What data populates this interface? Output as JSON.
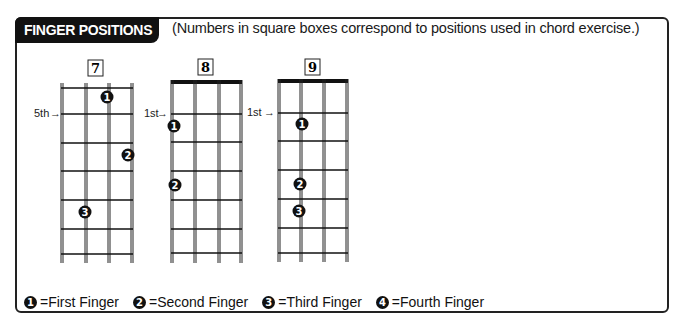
{
  "header": {
    "title": "FINGER POSITIONS",
    "subtitle": "(Numbers in square boxes correspond to positions used in chord exercise.)"
  },
  "diagrams": [
    {
      "number": "7",
      "position_label": "5th",
      "arrow": "→",
      "has_nut": false,
      "fingers": [
        {
          "finger": "1",
          "string": 3,
          "fret_space": 0
        },
        {
          "finger": "2",
          "string": 4,
          "fret_space": 2
        },
        {
          "finger": "3",
          "string": 2,
          "fret_space": 4
        }
      ]
    },
    {
      "number": "8",
      "position_label": "1st",
      "arrow": "→",
      "has_nut": true,
      "fingers": [
        {
          "finger": "1",
          "string": 1,
          "fret_space": 1
        },
        {
          "finger": "2",
          "string": 1,
          "fret_space": 3
        }
      ]
    },
    {
      "number": "9",
      "position_label": "1st",
      "arrow": "→",
      "has_nut": true,
      "fingers": [
        {
          "finger": "1",
          "string": 2,
          "fret_space": 1
        },
        {
          "finger": "2",
          "string": 2,
          "fret_space": 3
        },
        {
          "finger": "3",
          "string": 2,
          "fret_space": 4
        }
      ]
    }
  ],
  "legend": [
    {
      "symbol": "1",
      "label": "=First Finger"
    },
    {
      "symbol": "2",
      "label": "=Second Finger"
    },
    {
      "symbol": "3",
      "label": "=Third Finger"
    },
    {
      "symbol": "4",
      "label": "=Fourth Finger"
    }
  ],
  "colors": {
    "ink": "#111111",
    "background": "#ffffff"
  }
}
